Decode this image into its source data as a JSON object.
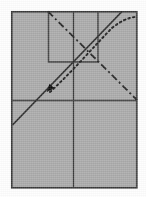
{
  "figure": {
    "title": "",
    "canvas": {
      "width": 146,
      "height": 197,
      "background": "#fdfdfd"
    },
    "colors": {
      "panel_fill": "#a9a9a9",
      "panel_stroke": "#3a3a3a",
      "line_solid": "#2b2b2b",
      "line_dashdot": "#232323",
      "line_dotted": "#1f1f1f",
      "arrow_fill": "#0d0d0d"
    },
    "outer_panel": {
      "name": "outer-rectangle",
      "x": 11,
      "y": 11,
      "width": 126,
      "height": 177,
      "fill": "#a9a9a9",
      "stroke": "#3a3a3a",
      "stroke_width": 1.6
    },
    "inner_panel": {
      "name": "inner-rectangle",
      "x": 48,
      "y": 10,
      "width": 50,
      "height": 52,
      "stroke": "#3a3a3a",
      "stroke_width": 1.3,
      "open_edge": "top"
    },
    "axis_lines": [
      {
        "name": "horizontal-divider",
        "orientation": "horizontal",
        "x1": 11,
        "y1": 100,
        "x2": 137,
        "y2": 100,
        "stroke_width": 1.3
      },
      {
        "name": "vertical-divider",
        "orientation": "vertical",
        "x1": 73,
        "y1": 11,
        "x2": 73,
        "y2": 188,
        "stroke_width": 1.3
      }
    ],
    "curves": [
      {
        "name": "solid-diagonal",
        "style": "solid",
        "stroke_width": 1.7,
        "points": [
          [
            12,
            125
          ],
          [
            122,
            11
          ]
        ]
      },
      {
        "name": "dash-dot-diagonal",
        "style": "dash-dot",
        "stroke_width": 1.7,
        "dash_pattern": "7 3 2 3",
        "points": [
          [
            48,
            11
          ],
          [
            137,
            100
          ]
        ]
      },
      {
        "name": "dotted-rising-curve",
        "style": "dotted",
        "stroke_width": 1.9,
        "dash_pattern": "1.5 3",
        "path": "M 50,92 C 74,70 96,44 112,28 C 120,21 128,18 134,17"
      }
    ],
    "markers": [
      {
        "name": "arrowhead-marker",
        "shape": "triangle",
        "x": 52,
        "y": 86,
        "size": 7,
        "direction": "down-right",
        "fill": "#0d0d0d"
      }
    ]
  }
}
